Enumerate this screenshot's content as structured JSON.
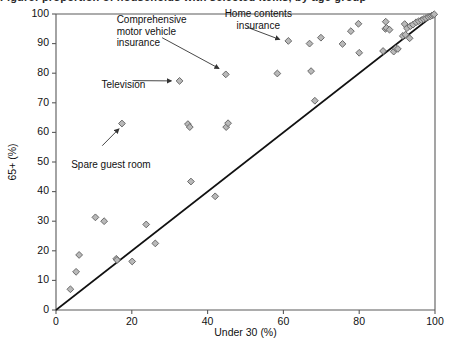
{
  "title": "Figure: proportion of households with selected items, by age group",
  "chart_data": {
    "type": "scatter",
    "title": "",
    "xlabel": "Under 30 (%)",
    "ylabel": "65+ (%)",
    "xlim": [
      0,
      100
    ],
    "ylim": [
      0,
      100
    ],
    "xticks": [
      0,
      20,
      40,
      60,
      80,
      100
    ],
    "yticks": [
      0,
      10,
      20,
      30,
      40,
      50,
      60,
      70,
      80,
      90,
      100
    ],
    "grid": false,
    "legend": "none",
    "reference_line": {
      "label": "y = x (equality line)",
      "from": [
        0,
        0
      ],
      "to": [
        100,
        100
      ]
    },
    "marker": {
      "shape": "diamond",
      "fill": "#b9b9b9",
      "stroke": "#6a6a6a"
    },
    "points": [
      {
        "x": 3.8,
        "y": 7.0
      },
      {
        "x": 5.3,
        "y": 12.9
      },
      {
        "x": 6.1,
        "y": 18.6
      },
      {
        "x": 10.4,
        "y": 31.3
      },
      {
        "x": 12.7,
        "y": 30.0
      },
      {
        "x": 15.9,
        "y": 17.3
      },
      {
        "x": 16.1,
        "y": 16.9
      },
      {
        "x": 17.4,
        "y": 63.0
      },
      {
        "x": 20.1,
        "y": 16.4
      },
      {
        "x": 23.8,
        "y": 28.9
      },
      {
        "x": 26.2,
        "y": 22.5
      },
      {
        "x": 32.6,
        "y": 77.4
      },
      {
        "x": 34.8,
        "y": 62.8
      },
      {
        "x": 35.3,
        "y": 61.8
      },
      {
        "x": 35.6,
        "y": 43.4
      },
      {
        "x": 42.0,
        "y": 38.4
      },
      {
        "x": 44.9,
        "y": 61.8
      },
      {
        "x": 45.4,
        "y": 63.1
      },
      {
        "x": 44.8,
        "y": 79.6
      },
      {
        "x": 58.4,
        "y": 79.9
      },
      {
        "x": 61.3,
        "y": 90.9
      },
      {
        "x": 66.9,
        "y": 90.0
      },
      {
        "x": 67.3,
        "y": 80.7
      },
      {
        "x": 68.3,
        "y": 70.7
      },
      {
        "x": 69.9,
        "y": 92.0
      },
      {
        "x": 75.6,
        "y": 89.9
      },
      {
        "x": 77.8,
        "y": 94.2
      },
      {
        "x": 79.8,
        "y": 96.7
      },
      {
        "x": 80.0,
        "y": 86.9
      },
      {
        "x": 86.3,
        "y": 87.5
      },
      {
        "x": 86.9,
        "y": 95.0
      },
      {
        "x": 87.0,
        "y": 97.4
      },
      {
        "x": 87.2,
        "y": 95.3
      },
      {
        "x": 88.0,
        "y": 94.7
      },
      {
        "x": 89.1,
        "y": 87.3
      },
      {
        "x": 89.7,
        "y": 88.4
      },
      {
        "x": 90.2,
        "y": 88.2
      },
      {
        "x": 91.5,
        "y": 92.6
      },
      {
        "x": 92.0,
        "y": 96.6
      },
      {
        "x": 92.2,
        "y": 93.0
      },
      {
        "x": 92.6,
        "y": 95.2
      },
      {
        "x": 93.3,
        "y": 91.8
      },
      {
        "x": 93.5,
        "y": 95.9
      },
      {
        "x": 94.2,
        "y": 96.4
      },
      {
        "x": 95.0,
        "y": 97.2
      },
      {
        "x": 95.7,
        "y": 97.6
      },
      {
        "x": 96.4,
        "y": 97.9
      },
      {
        "x": 97.0,
        "y": 98.3
      },
      {
        "x": 97.6,
        "y": 98.6
      },
      {
        "x": 98.2,
        "y": 99.0
      },
      {
        "x": 98.8,
        "y": 99.2
      },
      {
        "x": 99.2,
        "y": 99.5
      },
      {
        "x": 99.6,
        "y": 99.7
      },
      {
        "x": 99.8,
        "y": 99.9
      }
    ],
    "annotations": [
      {
        "id": "home-contents-insurance",
        "label": "Home contents\ninsurance",
        "text_x": 44.5,
        "text_y": 102.0,
        "target": {
          "x": 61.3,
          "y": 90.9
        }
      },
      {
        "id": "comprehensive-motor-vehicle-insurance",
        "label": "Comprehensive\nmotor vehicle\ninsurance",
        "text_x": 16.0,
        "text_y": 100.0,
        "target": {
          "x": 44.8,
          "y": 79.6
        }
      },
      {
        "id": "television",
        "label": "Television",
        "text_x": 12.0,
        "text_y": 78.0,
        "target": {
          "x": 32.6,
          "y": 77.4
        }
      },
      {
        "id": "spare-guest-room",
        "label": "Spare guest room",
        "text_x": 4.0,
        "text_y": 51.0,
        "target": {
          "x": 17.4,
          "y": 63.0
        }
      }
    ]
  }
}
